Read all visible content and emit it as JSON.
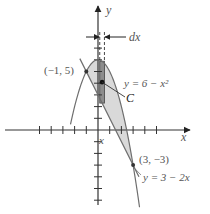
{
  "figure": {
    "axis_x_label": "x",
    "axis_y_label": "y",
    "strip_label": "x",
    "width_label": "dx",
    "centroid_label": "C",
    "point_left_label": "(−1, 5)",
    "point_right_label": "(3, −3)",
    "curve_parabola_label": "y = 6 − x²",
    "curve_line_label": "y = 3 − 2x",
    "colors": {
      "region_fill": "#d9d9d9",
      "strip_fill": "#8c8c8c",
      "curve": "#6e6e6e",
      "axis": "#333333",
      "label": "#555555"
    }
  },
  "math": {
    "parabola": {
      "a": -1,
      "b": 0,
      "c": 6
    },
    "line": {
      "m": -2,
      "b": 3
    },
    "intersections": [
      [
        -1,
        5
      ],
      [
        3,
        -3
      ]
    ],
    "strip_x": 0.35,
    "strip_dx": 0.4,
    "x_range": [
      -8,
      9
    ],
    "y_range": [
      -7,
      10
    ]
  }
}
